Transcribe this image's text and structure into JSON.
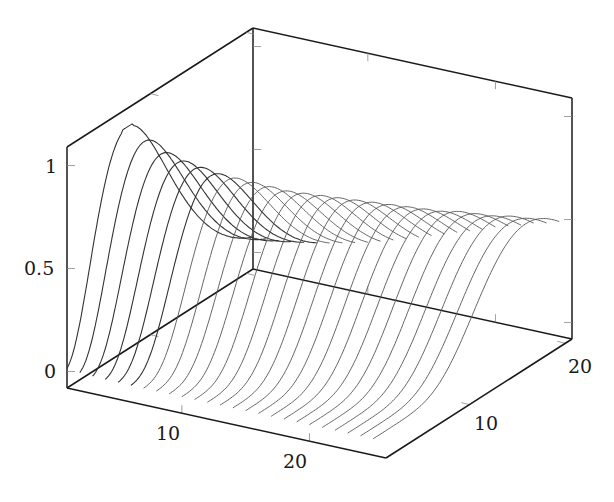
{
  "chart_data": {
    "type": "line",
    "subtype": "3d-waterfall",
    "title": "",
    "xlabel": "",
    "ylabel": "",
    "zlabel": "",
    "xlim": [
      1,
      26
    ],
    "ylim": [
      1.3,
      20.7
    ],
    "zlim": [
      -0.08,
      1.09
    ],
    "x_ticks": [
      10,
      20
    ],
    "x_tick_labels": [
      "10",
      "20"
    ],
    "y_ticks": [
      10,
      20
    ],
    "y_tick_labels": [
      "10",
      "20"
    ],
    "z_ticks": [
      0,
      0.5,
      1
    ],
    "z_tick_labels": [
      "0",
      "0.5",
      "1"
    ],
    "grid": false,
    "legend": null,
    "series_count": 25,
    "series_x_values": [
      1,
      2,
      3,
      4,
      5,
      6,
      7,
      8,
      9,
      10,
      11,
      12,
      13,
      14,
      15,
      16,
      17,
      18,
      19,
      20,
      21,
      22,
      23,
      24,
      25
    ],
    "peak_z_per_series": [
      1.0,
      0.93,
      0.87,
      0.83,
      0.8,
      0.77,
      0.75,
      0.73,
      0.71,
      0.69,
      0.68,
      0.67,
      0.66,
      0.65,
      0.64,
      0.63,
      0.62,
      0.61,
      0.6,
      0.6,
      0.59,
      0.58,
      0.58,
      0.57,
      0.57
    ],
    "peak_y_per_series": [
      7.6,
      8.0,
      8.4,
      8.8,
      9.2,
      9.6,
      10.0,
      10.4,
      10.8,
      11.2,
      11.6,
      12.0,
      12.4,
      12.8,
      13.2,
      13.6,
      14.0,
      14.4,
      14.8,
      15.2,
      15.6,
      16.0,
      16.4,
      16.8,
      17.2
    ],
    "colors": {
      "box": "#1a1a1a",
      "curve": "#555555",
      "tick": "#888888"
    }
  },
  "labels": {
    "z0": "0",
    "z05": "0.5",
    "z1": "1",
    "x10": "10",
    "x20": "20",
    "y10": "10",
    "y20": "20"
  }
}
